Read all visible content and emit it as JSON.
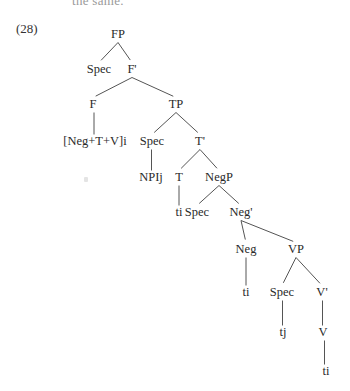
{
  "page": {
    "cutoff_text": "the same.",
    "example_number": "(28)"
  },
  "tree": {
    "nodes": [
      {
        "id": "FP",
        "label": "FP",
        "x": 118,
        "y": 35
      },
      {
        "id": "Spec1",
        "label": "Spec",
        "x": 99,
        "y": 70
      },
      {
        "id": "Fbar",
        "label": "F'",
        "x": 132,
        "y": 70
      },
      {
        "id": "F",
        "label": "F",
        "x": 93,
        "y": 105
      },
      {
        "id": "TP",
        "label": "TP",
        "x": 176,
        "y": 105
      },
      {
        "id": "NegTV",
        "label": "[Neg+T+V]i",
        "x": 95,
        "y": 142
      },
      {
        "id": "Spec2",
        "label": "Spec",
        "x": 152,
        "y": 142
      },
      {
        "id": "Tbar",
        "label": "T'",
        "x": 200,
        "y": 142
      },
      {
        "id": "NPIj",
        "label": "NPIj",
        "x": 151,
        "y": 178
      },
      {
        "id": "T",
        "label": "T",
        "x": 179,
        "y": 178
      },
      {
        "id": "NegP",
        "label": "NegP",
        "x": 219,
        "y": 178
      },
      {
        "id": "ti1",
        "label": "ti",
        "x": 179,
        "y": 213
      },
      {
        "id": "Spec3",
        "label": "Spec",
        "x": 197,
        "y": 213
      },
      {
        "id": "Negbar",
        "label": "Neg'",
        "x": 241,
        "y": 213
      },
      {
        "id": "Neg",
        "label": "Neg",
        "x": 246,
        "y": 250
      },
      {
        "id": "VP",
        "label": "VP",
        "x": 296,
        "y": 250
      },
      {
        "id": "ti2",
        "label": "ti",
        "x": 246,
        "y": 293
      },
      {
        "id": "Spec4",
        "label": "Spec",
        "x": 282,
        "y": 293
      },
      {
        "id": "Vbar",
        "label": "V'",
        "x": 322,
        "y": 293
      },
      {
        "id": "tj",
        "label": "tj",
        "x": 283,
        "y": 333
      },
      {
        "id": "V",
        "label": "V",
        "x": 323,
        "y": 333
      },
      {
        "id": "ti3",
        "label": "ti",
        "x": 326,
        "y": 372
      }
    ],
    "edges": [
      {
        "from": "FP",
        "to": "Spec1"
      },
      {
        "from": "FP",
        "to": "Fbar"
      },
      {
        "from": "Fbar",
        "to": "F"
      },
      {
        "from": "Fbar",
        "to": "TP"
      },
      {
        "from": "F",
        "to": "NegTV"
      },
      {
        "from": "TP",
        "to": "Spec2"
      },
      {
        "from": "TP",
        "to": "Tbar"
      },
      {
        "from": "Spec2",
        "to": "NPIj"
      },
      {
        "from": "Tbar",
        "to": "T"
      },
      {
        "from": "Tbar",
        "to": "NegP"
      },
      {
        "from": "T",
        "to": "ti1"
      },
      {
        "from": "NegP",
        "to": "Spec3"
      },
      {
        "from": "NegP",
        "to": "Negbar"
      },
      {
        "from": "Negbar",
        "to": "Neg"
      },
      {
        "from": "Negbar",
        "to": "VP"
      },
      {
        "from": "Neg",
        "to": "ti2"
      },
      {
        "from": "VP",
        "to": "Spec4"
      },
      {
        "from": "VP",
        "to": "Vbar"
      },
      {
        "from": "Spec4",
        "to": "tj"
      },
      {
        "from": "Vbar",
        "to": "V"
      },
      {
        "from": "V",
        "to": "ti3"
      }
    ]
  }
}
